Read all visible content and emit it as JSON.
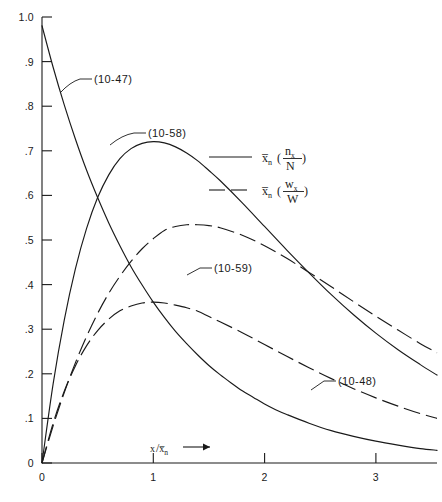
{
  "chart_data": {
    "type": "line",
    "title": "",
    "xlabel": "x/x̄ₙ",
    "ylabel": "",
    "xlim": [
      0,
      3.55
    ],
    "ylim": [
      0,
      1.02
    ],
    "grid": false,
    "x_ticks": [
      "0",
      "1",
      "2",
      "3"
    ],
    "x_tick_values": [
      0,
      1,
      2,
      3
    ],
    "y_ticks": [
      "0",
      ".1",
      ".2",
      ".3",
      ".4",
      ".5",
      ".6",
      ".7",
      ".8",
      ".9",
      "1.0"
    ],
    "y_tick_values": [
      0,
      0.1,
      0.2,
      0.3,
      0.4,
      0.5,
      0.6,
      0.7,
      0.8,
      0.9,
      1.0
    ],
    "legend_position": "upper-right-inside",
    "legend": [
      {
        "label": "x̄ₙ(nₓ/N)",
        "style": "solid",
        "numerator": "nₓ",
        "denominator": "N",
        "prefix": "x̄ₙ"
      },
      {
        "label": "x̄ₙ(wₓ/W)",
        "style": "dashed",
        "numerator": "wₓ",
        "denominator": "W",
        "prefix": "x̄ₙ"
      }
    ],
    "annotations": [
      {
        "text": "(10-47)",
        "curve": "10-47"
      },
      {
        "text": "(10-58)",
        "curve": "10-58"
      },
      {
        "text": "(10-59)",
        "curve": "10-59"
      },
      {
        "text": "(10-48)",
        "curve": "10-48"
      }
    ],
    "series": [
      {
        "name": "(10-47)",
        "style": "solid",
        "x": [
          0.0,
          0.1,
          0.2,
          0.3,
          0.4,
          0.5,
          0.6,
          0.7,
          0.8,
          0.9,
          1.0,
          1.1,
          1.2,
          1.3,
          1.4,
          1.5,
          1.6,
          1.7,
          1.8,
          1.9,
          2.0,
          2.1,
          2.2,
          2.4,
          2.6,
          2.8,
          3.0,
          3.2,
          3.4,
          3.55
        ],
        "y": [
          1.0,
          0.905,
          0.819,
          0.741,
          0.67,
          0.607,
          0.549,
          0.497,
          0.449,
          0.407,
          0.368,
          0.333,
          0.301,
          0.273,
          0.247,
          0.223,
          0.202,
          0.183,
          0.165,
          0.15,
          0.135,
          0.122,
          0.111,
          0.091,
          0.074,
          0.061,
          0.05,
          0.041,
          0.033,
          0.029
        ]
      },
      {
        "name": "(10-58)",
        "style": "solid",
        "x": [
          0.0,
          0.1,
          0.2,
          0.3,
          0.4,
          0.5,
          0.6,
          0.7,
          0.8,
          0.9,
          1.0,
          1.1,
          1.2,
          1.3,
          1.4,
          1.5,
          1.6,
          1.8,
          2.0,
          2.2,
          2.4,
          2.6,
          2.8,
          3.0,
          3.2,
          3.4,
          3.55
        ],
        "y": [
          0.0,
          0.181,
          0.327,
          0.444,
          0.536,
          0.607,
          0.659,
          0.696,
          0.719,
          0.731,
          0.735,
          0.732,
          0.723,
          0.709,
          0.691,
          0.669,
          0.646,
          0.595,
          0.541,
          0.487,
          0.435,
          0.385,
          0.339,
          0.297,
          0.259,
          0.225,
          0.201
        ]
      },
      {
        "name": "(10-59)",
        "style": "dashed",
        "x": [
          0.0,
          0.1,
          0.2,
          0.3,
          0.4,
          0.5,
          0.6,
          0.7,
          0.8,
          0.9,
          1.0,
          1.1,
          1.2,
          1.3,
          1.4,
          1.5,
          1.6,
          1.8,
          2.0,
          2.2,
          2.4,
          2.6,
          2.8,
          3.0,
          3.2,
          3.4,
          3.55
        ],
        "y": [
          0.0,
          0.085,
          0.161,
          0.229,
          0.289,
          0.342,
          0.388,
          0.427,
          0.461,
          0.49,
          0.513,
          0.532,
          0.541,
          0.545,
          0.545,
          0.543,
          0.538,
          0.521,
          0.497,
          0.468,
          0.436,
          0.403,
          0.369,
          0.336,
          0.304,
          0.273,
          0.252
        ]
      },
      {
        "name": "(10-48)",
        "style": "dashed",
        "x": [
          0.0,
          0.1,
          0.2,
          0.3,
          0.4,
          0.5,
          0.6,
          0.7,
          0.8,
          0.9,
          1.0,
          1.1,
          1.2,
          1.3,
          1.4,
          1.5,
          1.6,
          1.8,
          2.0,
          2.2,
          2.4,
          2.6,
          2.8,
          3.0,
          3.2,
          3.4,
          3.55
        ],
        "y": [
          0.0,
          0.091,
          0.164,
          0.222,
          0.268,
          0.303,
          0.329,
          0.348,
          0.359,
          0.366,
          0.368,
          0.366,
          0.361,
          0.355,
          0.347,
          0.335,
          0.323,
          0.298,
          0.271,
          0.244,
          0.218,
          0.193,
          0.17,
          0.149,
          0.13,
          0.113,
          0.102
        ]
      }
    ]
  }
}
